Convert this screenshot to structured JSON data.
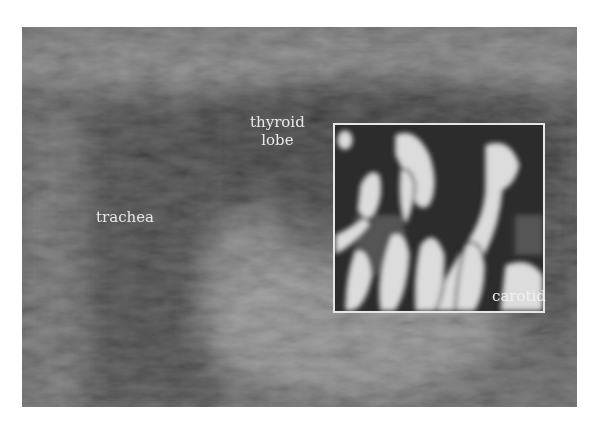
{
  "figure": {
    "type": "ultrasound",
    "labels": {
      "trachea": "trachea",
      "thyroid_line1": "thyroid",
      "thyroid_line2": "lobe",
      "carotid": "carotid"
    },
    "colors": {
      "background": "#ffffff",
      "tissue_dark": "#2e2e2e",
      "tissue_mid": "#6a6a6a",
      "tissue_light": "#9a9a9a",
      "roi_border": "#e6e6e6",
      "flow_bright": "#e8e8e8",
      "label_text": "#e8e8e8"
    }
  }
}
